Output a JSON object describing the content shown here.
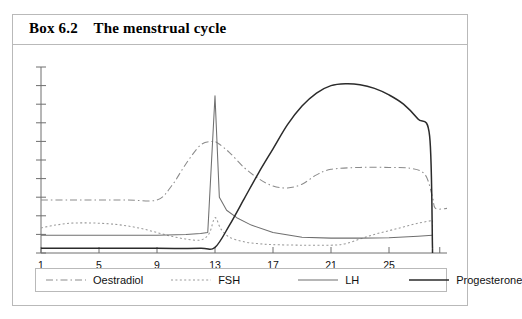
{
  "box": {
    "label": "Box 6.2",
    "title": "The menstrual cycle",
    "title_full": "Box 6.2    The menstrual cycle"
  },
  "chart_data": {
    "type": "line",
    "title": "The menstrual cycle",
    "xlabel": "",
    "ylabel": "",
    "x": [
      1,
      5,
      9,
      13,
      17,
      21,
      25
    ],
    "xtick_labels": [
      "1",
      "5",
      "9",
      "13",
      "17",
      "21",
      "25"
    ],
    "xlim": [
      1,
      29
    ],
    "ylim": [
      0,
      10
    ],
    "yticks_labeled": false,
    "ytick_count": 10,
    "grid": false,
    "legend_position": "bottom",
    "series": [
      {
        "name": "Oestradiol",
        "style": "dash-dot",
        "color": "#8b8b8b",
        "x": [
          1,
          3,
          5,
          7,
          9,
          10,
          11,
          12,
          12.8,
          13.2,
          14,
          15,
          16,
          17,
          18,
          19,
          20,
          21,
          23,
          25,
          26.5,
          27.5,
          28,
          28.2,
          29
        ],
        "values": [
          2.85,
          2.85,
          2.85,
          2.85,
          2.85,
          3.6,
          4.8,
          5.8,
          6.0,
          5.9,
          5.4,
          4.6,
          4.0,
          3.6,
          3.5,
          3.7,
          4.2,
          4.5,
          4.6,
          4.6,
          4.55,
          4.2,
          3.0,
          2.4,
          2.4
        ]
      },
      {
        "name": "FSH",
        "style": "dotted",
        "color": "#9a9a9a",
        "x": [
          1,
          2,
          3,
          4,
          5,
          6,
          7,
          8,
          9,
          10,
          11,
          12,
          12.6,
          13,
          13.4,
          14,
          15,
          16,
          17,
          19,
          21,
          22,
          23,
          24,
          25,
          26,
          27,
          28
        ],
        "values": [
          1.35,
          1.5,
          1.6,
          1.62,
          1.6,
          1.55,
          1.45,
          1.3,
          1.1,
          0.9,
          0.75,
          0.7,
          1.05,
          1.9,
          1.3,
          0.85,
          0.6,
          0.5,
          0.45,
          0.42,
          0.42,
          0.5,
          0.75,
          1.0,
          1.2,
          1.4,
          1.6,
          1.75
        ]
      },
      {
        "name": "LH",
        "style": "solid-thin",
        "color": "#6f6f6f",
        "x": [
          1,
          5,
          9,
          11,
          12,
          12.5,
          12.6,
          13.0,
          13.3,
          13.8,
          14.5,
          15.5,
          17,
          19,
          21,
          23,
          25,
          27,
          28
        ],
        "values": [
          0.95,
          0.95,
          0.95,
          1.0,
          1.05,
          1.1,
          2.55,
          8.45,
          3.0,
          2.3,
          1.9,
          1.5,
          1.1,
          0.85,
          0.8,
          0.8,
          0.82,
          0.9,
          0.95
        ]
      },
      {
        "name": "Progesterone",
        "style": "solid-thick",
        "color": "#2b2b2b",
        "x": [
          1,
          5,
          9,
          12,
          13,
          14,
          15,
          16,
          17,
          18,
          19,
          20,
          21,
          22,
          23,
          24,
          25,
          26,
          27,
          27.8,
          28
        ],
        "values": [
          0.25,
          0.25,
          0.25,
          0.25,
          0.3,
          1.5,
          2.9,
          4.3,
          5.6,
          6.9,
          7.9,
          8.6,
          9.0,
          9.1,
          9.05,
          8.85,
          8.5,
          8.0,
          7.2,
          6.3,
          0.25
        ]
      }
    ]
  },
  "legend": {
    "items": [
      {
        "label": "Oestradiol",
        "swatch": "dash-dot-line-icon"
      },
      {
        "label": "FSH",
        "swatch": "dotted-line-icon"
      },
      {
        "label": "LH",
        "swatch": "thin-solid-line-icon"
      },
      {
        "label": "Progesterone",
        "swatch": "thick-solid-line-icon"
      }
    ]
  },
  "colors": {
    "frame": "#b9b9b9",
    "axis": "#6e6e6e",
    "text": "#111111",
    "oestradiol": "#8b8b8b",
    "fsh": "#9a9a9a",
    "lh": "#6f6f6f",
    "progesterone": "#2b2b2b"
  }
}
